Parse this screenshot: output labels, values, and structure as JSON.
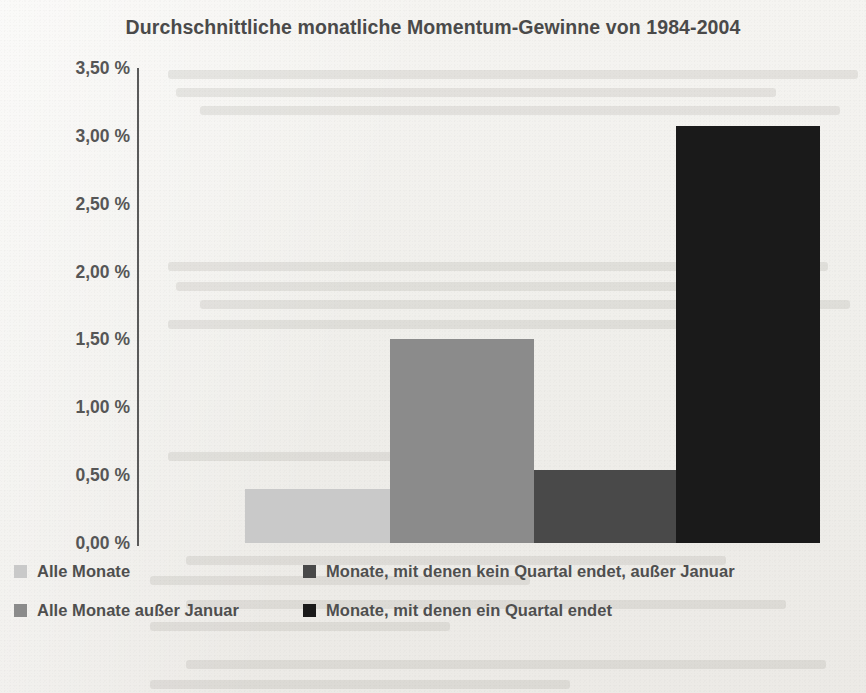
{
  "chart_data": {
    "type": "bar",
    "title": "Durchschnittliche monatliche Momentum-Gewinne von 1984-2004",
    "xlabel": "",
    "ylabel": "",
    "ylim": [
      0,
      3.5
    ],
    "grid": false,
    "legend_position": "bottom",
    "value_format": "percent-de",
    "categories": [
      "Alle Monate",
      "Alle Monate außer Januar",
      "Monate, mit denen kein Quartal endet, außer Januar",
      "Monate, mit denen ein Quartal endet"
    ],
    "values": [
      0.4,
      1.5,
      0.54,
      3.07
    ],
    "colors": [
      "#c9c9c9",
      "#8b8b8b",
      "#494949",
      "#1a1a1a"
    ],
    "yticks": [
      0.0,
      0.5,
      1.0,
      1.5,
      2.0,
      2.5,
      3.0,
      3.5
    ],
    "ytick_labels": [
      "0,00 %",
      "0,50 %",
      "1,00 %",
      "1,50 %",
      "2,00 %",
      "2,50 %",
      "3,00 %",
      "3,50 %"
    ]
  },
  "legend": {
    "items": [
      {
        "label": "Alle Monate",
        "color": "#c9c9c9"
      },
      {
        "label": "Alle Monate außer Januar",
        "color": "#8b8b8b"
      },
      {
        "label": "Monate, mit denen kein Quartal endet, außer Januar",
        "color": "#494949"
      },
      {
        "label": "Monate, mit denen ein Quartal endet",
        "color": "#1a1a1a"
      }
    ]
  }
}
